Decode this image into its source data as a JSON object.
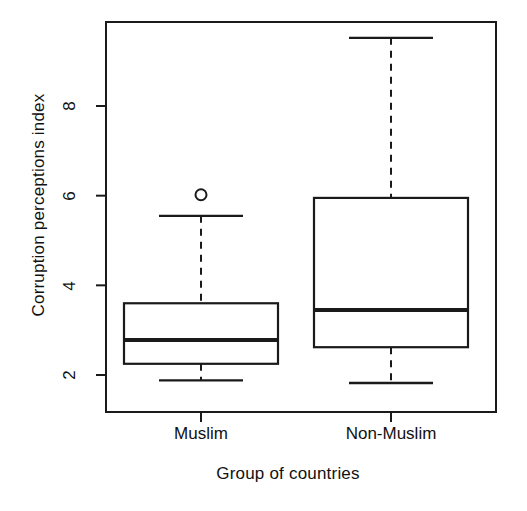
{
  "chart_data": {
    "type": "box",
    "title": "",
    "xlabel": "Group of countries",
    "ylabel": "Corruption perceptions index",
    "categories": [
      "Muslim",
      "Non-Muslim"
    ],
    "ytick_labels": [
      "2",
      "4",
      "6",
      "8"
    ],
    "ytick_values": [
      2,
      4,
      6,
      8
    ],
    "ylim": [
      1.55,
      9.85
    ],
    "grid": false,
    "legend": "none",
    "frame": "box",
    "boxes": [
      {
        "name": "Muslim",
        "whisker_low": 1.88,
        "q1": 2.25,
        "median": 2.78,
        "q3": 3.6,
        "whisker_high": 5.55,
        "outliers": [
          6.02
        ]
      },
      {
        "name": "Non-Muslim",
        "whisker_low": 1.82,
        "q1": 2.62,
        "median": 3.45,
        "q3": 5.95,
        "whisker_high": 9.52,
        "outliers": []
      }
    ]
  }
}
